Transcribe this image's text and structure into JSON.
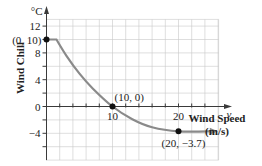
{
  "chart_data": {
    "type": "line",
    "title": "",
    "xlabel": "Wind Speed",
    "xlabel_units": "(m/s)",
    "x_variable": "v",
    "ylabel": "Wind Chill",
    "y_units": "°C",
    "xlim": [
      0,
      26
    ],
    "ylim": [
      -8,
      13
    ],
    "grid": true,
    "x_ticks": [
      2,
      4,
      6,
      8,
      10,
      12,
      14,
      16,
      18,
      20,
      22,
      24
    ],
    "x_tick_labels": [
      {
        "value": 10,
        "label": "10"
      },
      {
        "value": 20,
        "label": "20"
      }
    ],
    "y_ticks": [
      -6,
      -4,
      -2,
      0,
      2,
      4,
      6,
      8,
      10,
      12
    ],
    "y_tick_labels": [
      {
        "value": 12,
        "label": "12"
      },
      {
        "value": 8,
        "label": "8"
      },
      {
        "value": 4,
        "label": "4"
      },
      {
        "value": 0,
        "label": "0"
      },
      {
        "value": -4,
        "label": "−4"
      }
    ],
    "series": [
      {
        "name": "Wind Chill",
        "points": [
          {
            "x": 0,
            "y": 10
          },
          {
            "x": 1.5,
            "y": 10
          },
          {
            "x": 3,
            "y": 7.6
          },
          {
            "x": 5,
            "y": 4.9
          },
          {
            "x": 7,
            "y": 2.7
          },
          {
            "x": 10,
            "y": 0
          },
          {
            "x": 13,
            "y": -1.9
          },
          {
            "x": 16,
            "y": -3.1
          },
          {
            "x": 20,
            "y": -3.7
          },
          {
            "x": 25.5,
            "y": -3.7
          }
        ],
        "end_arrow": true
      }
    ],
    "annotations": [
      {
        "x": 0,
        "y": 10,
        "label": "(0, 10)"
      },
      {
        "x": 10,
        "y": 0,
        "label": "(10, 0)"
      },
      {
        "x": 20,
        "y": -3.7,
        "label": "(20, −3.7)"
      }
    ]
  }
}
